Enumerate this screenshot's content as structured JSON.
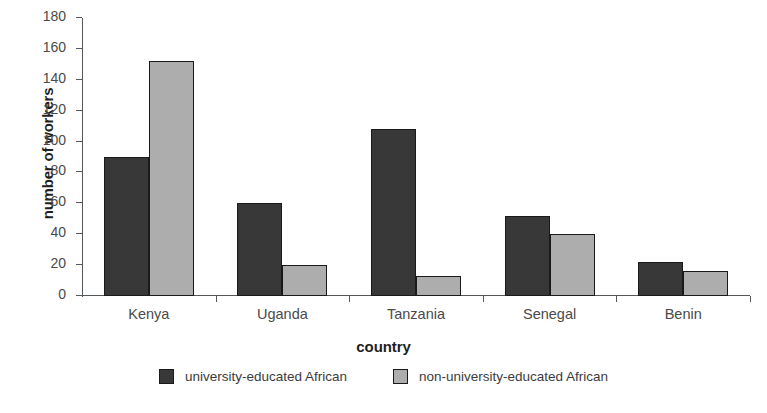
{
  "chart_data": {
    "type": "bar",
    "title": "",
    "xlabel": "country",
    "ylabel": "number of workers",
    "categories": [
      "Kenya",
      "Uganda",
      "Tanzania",
      "Senegal",
      "Benin"
    ],
    "series": [
      {
        "name": "university-educated African",
        "color": "#383838",
        "values": [
          90,
          60,
          108,
          52,
          22
        ]
      },
      {
        "name": "non-university-educated African",
        "color": "#adadad",
        "values": [
          152,
          20,
          13,
          40,
          16
        ]
      }
    ],
    "ylim": [
      0,
      180
    ],
    "ytick_step": 20,
    "yticks": [
      0,
      20,
      40,
      60,
      80,
      100,
      120,
      140,
      160,
      180
    ],
    "grid": false,
    "legend_position": "bottom"
  },
  "legend": {
    "entries": [
      {
        "label": "university-educated African",
        "swatch": "legend-swatch-dark"
      },
      {
        "label": "non-university-educated African",
        "swatch": "legend-swatch-light"
      }
    ]
  },
  "caption": {
    "sliver_text": ""
  }
}
